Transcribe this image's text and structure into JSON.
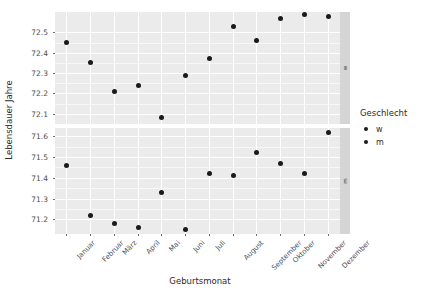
{
  "chart_data": {
    "type": "scatter",
    "title": "",
    "xlabel": "Geburtsmonat",
    "ylabel": "Lebensdauer Jahre",
    "categories": [
      "Januar",
      "Februar",
      "März",
      "April",
      "Mai",
      "Juni",
      "Juli",
      "August",
      "September",
      "Oktober",
      "November",
      "Dezember"
    ],
    "legend_title": "Geschlecht",
    "legend_entries": [
      "w",
      "m"
    ],
    "legend_position": "right",
    "grid": true,
    "facets": [
      {
        "strip_label": "w",
        "ylim": [
          72.05,
          72.6
        ],
        "yticks": [
          72.1,
          72.2,
          72.3,
          72.4,
          72.5
        ],
        "ytick_labels": [
          "72.1",
          "72.2",
          "72.3",
          "72.4",
          "72.5"
        ],
        "values": [
          72.45,
          72.35,
          72.21,
          72.24,
          72.08,
          72.29,
          72.37,
          72.53,
          72.46,
          72.57,
          72.59,
          72.58
        ]
      },
      {
        "strip_label": "m",
        "ylim": [
          71.13,
          71.64
        ],
        "yticks": [
          71.2,
          71.3,
          71.4,
          71.5,
          71.6
        ],
        "ytick_labels": [
          "71.2",
          "71.3",
          "71.4",
          "71.5",
          "71.6"
        ],
        "values": [
          71.46,
          71.22,
          71.18,
          71.16,
          71.33,
          71.15,
          71.42,
          71.41,
          71.52,
          71.47,
          71.42,
          71.62
        ]
      }
    ]
  },
  "axes": {
    "y_title": "Lebensdauer Jahre",
    "x_title": "Geburtsmonat"
  },
  "legend": {
    "title": "Geschlecht",
    "items": [
      {
        "label": "w"
      },
      {
        "label": "m"
      }
    ]
  },
  "colors": {
    "panel_background": "#ebebeb",
    "grid_major": "#ffffff",
    "grid_minor": "#f7f7f7",
    "point": "#1a1a1a",
    "strip_background": "#d5d5d5",
    "text": "#2b2b2b",
    "tick_text": "#4d4d4d"
  }
}
